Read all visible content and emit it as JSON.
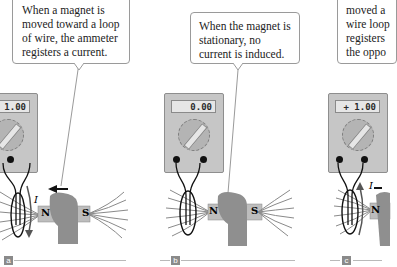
{
  "panels": [
    {
      "id": "a",
      "label": "a",
      "callout": "When a magnet is moved toward a loop of wire, the ammeter registers a current.",
      "meter_reading": "- 1.00",
      "current_label": "I",
      "magnet_north": "N",
      "magnet_south": "S",
      "motion": "toward loop"
    },
    {
      "id": "b",
      "label": "b",
      "callout": "When the magnet is stationary, no current is induced.",
      "meter_reading": "0.00",
      "magnet_north": "N",
      "magnet_south": "S",
      "motion": "stationary"
    },
    {
      "id": "c",
      "label": "c",
      "callout": "moved a wire loop registers the oppo",
      "meter_reading": "+ 1.00",
      "current_label": "I",
      "magnet_north": "N",
      "motion": "away from loop"
    }
  ],
  "colors": {
    "meter_body": "#c6c6c6",
    "hand": "#8f8f8f",
    "field_lines": "#8a8a8a",
    "wire": "#111111",
    "label_box": "#8a8a8a"
  }
}
